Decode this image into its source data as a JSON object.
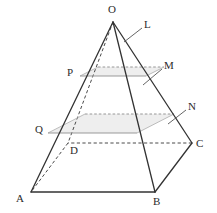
{
  "figure": {
    "type": "geometry-diagram",
    "canvas": {
      "width": 217,
      "height": 213
    },
    "colors": {
      "stroke_solid": "#333333",
      "stroke_dashed": "#4a4a4a",
      "stroke_light": "#aaaaaa",
      "fill_section": "#eeeeee",
      "label_text": "#2b2b2b",
      "background": "#ffffff"
    },
    "vertices": [
      {
        "name": "O",
        "label": "O",
        "x": 113,
        "y": 22,
        "label_x": 108,
        "label_y": 4
      },
      {
        "name": "A",
        "label": "A",
        "x": 31,
        "y": 192,
        "label_x": 16,
        "label_y": 193
      },
      {
        "name": "B",
        "label": "B",
        "x": 155,
        "y": 192,
        "label_x": 153,
        "label_y": 196
      },
      {
        "name": "C",
        "label": "C",
        "x": 192,
        "y": 143,
        "label_x": 196,
        "label_y": 138
      },
      {
        "name": "D",
        "label": "D",
        "x": 68,
        "y": 143,
        "label_x": 70,
        "label_y": 145
      }
    ],
    "section_points": [
      {
        "name": "P",
        "label": "P",
        "x": 80,
        "y": 76,
        "label_x": 67,
        "label_y": 67
      },
      {
        "name": "Q",
        "label": "Q",
        "x": 48,
        "y": 133,
        "label_x": 35,
        "label_y": 124
      }
    ],
    "leader_labels": [
      {
        "name": "L",
        "label": "L",
        "label_x": 144,
        "label_y": 19,
        "leader_from_x": 142,
        "leader_from_y": 28,
        "leader_to_x": 124,
        "leader_to_y": 42
      },
      {
        "name": "M",
        "label": "M",
        "label_x": 164,
        "label_y": 60,
        "leader_from_x": 162,
        "leader_from_y": 69,
        "leader_to_x": 143,
        "leader_to_y": 85
      },
      {
        "name": "N",
        "label": "N",
        "label_x": 188,
        "label_y": 101,
        "leader_from_x": 186,
        "leader_from_y": 110,
        "leader_to_x": 168,
        "leader_to_y": 124
      }
    ],
    "upper_section": {
      "front_y": 76,
      "back_y": 67,
      "front_left_x": 80,
      "front_right_x": 146,
      "back_left_x": 98,
      "back_right_x": 164
    },
    "lower_section": {
      "front_y": 133,
      "back_y": 114,
      "front_left_x": 48,
      "front_right_x": 137,
      "back_left_x": 85,
      "back_right_x": 174
    },
    "edges": [
      {
        "name": "O-A",
        "style": "solid"
      },
      {
        "name": "O-B",
        "style": "solid"
      },
      {
        "name": "O-C",
        "style": "solid"
      },
      {
        "name": "O-D",
        "style": "dashed"
      },
      {
        "name": "A-B",
        "style": "solid"
      },
      {
        "name": "B-C",
        "style": "solid"
      },
      {
        "name": "C-D",
        "style": "dashed"
      },
      {
        "name": "D-A",
        "style": "dashed"
      }
    ]
  }
}
